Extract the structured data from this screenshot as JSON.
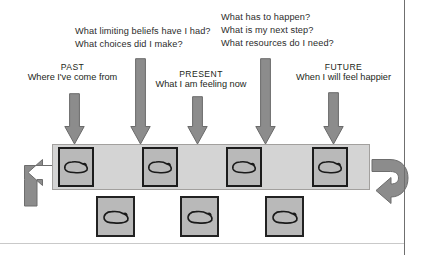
{
  "diagram": {
    "colors": {
      "arrow_fill": "#8c8c8c",
      "arrow_stroke": "#6d6d6d",
      "bar_fill": "#d4d4d4",
      "card_fill": "#b9b9b9",
      "card_border": "#1c1c1c",
      "text": "#2b2b2b",
      "page_border": "#6f6f6f"
    },
    "questions": [
      {
        "id": "past-questions",
        "lines": [
          "What limiting beliefs have I had?",
          "What choices did I make?"
        ]
      },
      {
        "id": "future-questions",
        "lines": [
          "What has to happen?",
          "What is my next step?",
          "What resources do I need?"
        ]
      }
    ],
    "eras": [
      {
        "id": "past",
        "name": "PAST",
        "subtitle": "Where I've come from"
      },
      {
        "id": "present",
        "name": "PRESENT",
        "subtitle": "What I am feeling now"
      },
      {
        "id": "future",
        "name": "FUTURE",
        "subtitle": "When I will feel happier"
      }
    ],
    "arrows": [
      {
        "id": "arrow-past",
        "x": 74,
        "top": 93,
        "height": 52
      },
      {
        "id": "arrow-past-questions",
        "x": 140,
        "top": 58,
        "height": 87
      },
      {
        "id": "arrow-present",
        "x": 197,
        "top": 96,
        "height": 49
      },
      {
        "id": "arrow-future-questions",
        "x": 265,
        "top": 58,
        "height": 87
      },
      {
        "id": "arrow-future",
        "x": 333,
        "top": 92,
        "height": 53
      }
    ],
    "timeline": {
      "id": "timeline-bar",
      "loop_back_arrow": "curved-arrow-left",
      "loop_forward_arrow": "curved-arrow-right",
      "cards_on_bar": [
        {
          "id": "card-past",
          "x": 58
        },
        {
          "id": "card-past-choices",
          "x": 142
        },
        {
          "id": "card-present",
          "x": 226
        },
        {
          "id": "card-future",
          "x": 312
        }
      ],
      "cards_below_bar": [
        {
          "id": "card-below-1",
          "x": 96
        },
        {
          "id": "card-below-2",
          "x": 180
        },
        {
          "id": "card-below-3",
          "x": 265
        }
      ]
    }
  }
}
